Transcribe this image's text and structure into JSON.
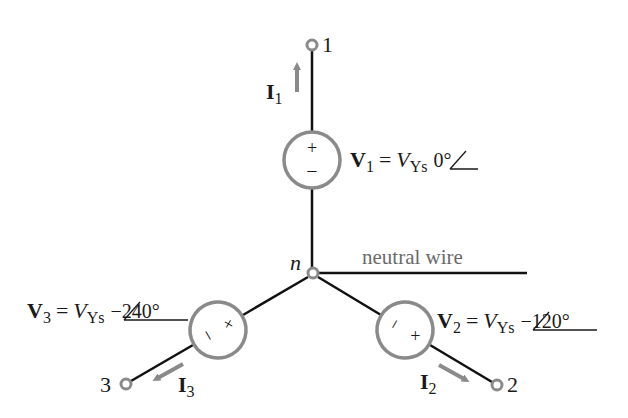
{
  "diagram": {
    "colors": {
      "wire": "#111111",
      "component": "#8a8a8a",
      "text": "#1a1a1a",
      "neutral_label": "#6a6a6a"
    },
    "node_n": {
      "label": "n"
    },
    "neutral_wire": {
      "label": "neutral wire"
    },
    "terminals": [
      {
        "id": "1",
        "label": "1"
      },
      {
        "id": "2",
        "label": "2"
      },
      {
        "id": "3",
        "label": "3"
      }
    ],
    "currents": [
      {
        "symbol": "I",
        "sub": "1"
      },
      {
        "symbol": "I",
        "sub": "2"
      },
      {
        "symbol": "I",
        "sub": "3"
      }
    ],
    "sources": [
      {
        "symbol": "V",
        "sub": "1",
        "eq": "=",
        "mag": "V",
        "mag_sub": "Ys",
        "angle": "0°",
        "plus": "+",
        "minus": "−"
      },
      {
        "symbol": "V",
        "sub": "2",
        "eq": "=",
        "mag": "V",
        "mag_sub": "Ys",
        "angle": "−120°",
        "plus": "+",
        "minus": "−"
      },
      {
        "symbol": "V",
        "sub": "3",
        "eq": "=",
        "mag": "V",
        "mag_sub": "Ys",
        "angle": "−240°",
        "plus": "+",
        "minus": "−"
      }
    ]
  }
}
